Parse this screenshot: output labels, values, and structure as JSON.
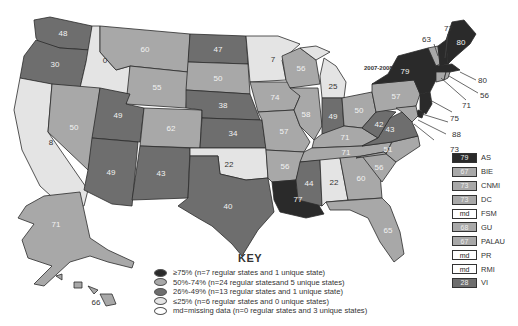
{
  "colors": {
    "high": "#2a2a2a",
    "mid_high": "#a8a8a8",
    "mid_low": "#6e6e6e",
    "low": "#e4e4e4",
    "missing": "#ffffff"
  },
  "map": {
    "period_label": "2007-2008",
    "states": [
      {
        "abbr": "WA",
        "value": "48",
        "category": "mid_low"
      },
      {
        "abbr": "OR",
        "value": "30",
        "category": "mid_low"
      },
      {
        "abbr": "CA",
        "value": "8",
        "category": "low"
      },
      {
        "abbr": "ID",
        "value": "0",
        "category": "low"
      },
      {
        "abbr": "NV",
        "value": "50",
        "category": "mid_high"
      },
      {
        "abbr": "MT",
        "value": "60",
        "category": "mid_high"
      },
      {
        "abbr": "WY",
        "value": "55",
        "category": "mid_high"
      },
      {
        "abbr": "UT",
        "value": "49",
        "category": "mid_low"
      },
      {
        "abbr": "AZ",
        "value": "49",
        "category": "mid_low"
      },
      {
        "abbr": "CO",
        "value": "62",
        "category": "mid_high"
      },
      {
        "abbr": "NM",
        "value": "43",
        "category": "mid_low"
      },
      {
        "abbr": "ND",
        "value": "47",
        "category": "mid_low"
      },
      {
        "abbr": "SD",
        "value": "50",
        "category": "mid_high"
      },
      {
        "abbr": "NE",
        "value": "38",
        "category": "mid_low"
      },
      {
        "abbr": "KS",
        "value": "34",
        "category": "mid_low"
      },
      {
        "abbr": "OK",
        "value": "22",
        "category": "low"
      },
      {
        "abbr": "TX",
        "value": "40",
        "category": "mid_low"
      },
      {
        "abbr": "MN",
        "value": "7",
        "category": "low"
      },
      {
        "abbr": "IA",
        "value": "74",
        "category": "mid_high"
      },
      {
        "abbr": "MO",
        "value": "57",
        "category": "mid_high"
      },
      {
        "abbr": "AR",
        "value": "56",
        "category": "mid_high"
      },
      {
        "abbr": "LA",
        "value": "77",
        "category": "high"
      },
      {
        "abbr": "WI",
        "value": "56",
        "category": "mid_high"
      },
      {
        "abbr": "IL",
        "value": "58",
        "category": "mid_high"
      },
      {
        "abbr": "MI",
        "value": "25",
        "category": "low"
      },
      {
        "abbr": "IN",
        "value": "49",
        "category": "mid_low"
      },
      {
        "abbr": "OH",
        "value": "50",
        "category": "mid_high"
      },
      {
        "abbr": "KY",
        "value": "71",
        "category": "mid_high"
      },
      {
        "abbr": "TN",
        "value": "71",
        "category": "mid_high"
      },
      {
        "abbr": "MS",
        "value": "44",
        "category": "mid_low"
      },
      {
        "abbr": "AL",
        "value": "22",
        "category": "low"
      },
      {
        "abbr": "GA",
        "value": "60",
        "category": "mid_high"
      },
      {
        "abbr": "FL",
        "value": "65",
        "category": "mid_high"
      },
      {
        "abbr": "SC",
        "value": "56",
        "category": "mid_high"
      },
      {
        "abbr": "NC",
        "value": "51",
        "category": "mid_high"
      },
      {
        "abbr": "VA",
        "value": "43",
        "category": "mid_low"
      },
      {
        "abbr": "WV",
        "value": "42",
        "category": "mid_low"
      },
      {
        "abbr": "PA",
        "value": "57",
        "category": "mid_high"
      },
      {
        "abbr": "NY",
        "value": "79",
        "category": "high"
      },
      {
        "abbr": "VT",
        "value": "63",
        "category": "mid_high"
      },
      {
        "abbr": "NH",
        "value": "77",
        "category": "high"
      },
      {
        "abbr": "ME",
        "value": "80",
        "category": "high"
      },
      {
        "abbr": "MA",
        "value": "80",
        "category": "high"
      },
      {
        "abbr": "RI",
        "value": "56",
        "category": "mid_high"
      },
      {
        "abbr": "CT",
        "value": "71",
        "category": "mid_high"
      },
      {
        "abbr": "NJ",
        "value": "75",
        "category": "high"
      },
      {
        "abbr": "DE",
        "value": "88",
        "category": "high"
      },
      {
        "abbr": "MD",
        "value": "73",
        "category": "mid_high"
      },
      {
        "abbr": "AK",
        "value": "71",
        "category": "mid_high"
      },
      {
        "abbr": "HI",
        "value": "66",
        "category": "mid_high"
      }
    ]
  },
  "key": {
    "title": "KEY",
    "items": [
      {
        "category": "high",
        "label": "≥75% (n=7 regular states and 1 unique state)"
      },
      {
        "category": "mid_high",
        "label": "50%-74% (n=24 regular statesand 5 unique states)"
      },
      {
        "category": "mid_low",
        "label": "26%-49% (n=13 regular states and 1 unique state)"
      },
      {
        "category": "low",
        "label": "≤25% (n=6 regular states and 0 unique states)"
      },
      {
        "category": "missing",
        "label": "md=missing data (n=0 regular states and 3 unique states)"
      }
    ]
  },
  "territories": [
    {
      "name": "AS",
      "value": "79",
      "category": "high"
    },
    {
      "name": "BIE",
      "value": "67",
      "category": "mid_high"
    },
    {
      "name": "CNMI",
      "value": "73",
      "category": "mid_high"
    },
    {
      "name": "DC",
      "value": "73",
      "category": "mid_high"
    },
    {
      "name": "FSM",
      "value": "md",
      "category": "missing"
    },
    {
      "name": "GU",
      "value": "68",
      "category": "mid_high"
    },
    {
      "name": "PALAU",
      "value": "67",
      "category": "mid_high"
    },
    {
      "name": "PR",
      "value": "md",
      "category": "missing"
    },
    {
      "name": "RMI",
      "value": "md",
      "category": "missing"
    },
    {
      "name": "VI",
      "value": "28",
      "category": "mid_low"
    }
  ]
}
